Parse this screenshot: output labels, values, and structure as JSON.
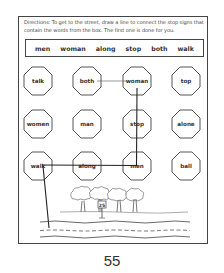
{
  "worksheet": {
    "directions": "Directions: To get to the street, draw a line to connect the stop signs that contain the words from the box. The first one is done for you.",
    "word_box": [
      "men",
      "woman",
      "along",
      "stop",
      "both",
      "walk"
    ],
    "stop_signs": [
      {
        "label": "talk",
        "row": 0,
        "col": 0
      },
      {
        "label": "both",
        "row": 0,
        "col": 1
      },
      {
        "label": "woman",
        "row": 0,
        "col": 2
      },
      {
        "label": "top",
        "row": 0,
        "col": 3
      },
      {
        "label": "women",
        "row": 1,
        "col": 0
      },
      {
        "label": "man",
        "row": 1,
        "col": 1
      },
      {
        "label": "stop",
        "row": 1,
        "col": 2
      },
      {
        "label": "alone",
        "row": 1,
        "col": 3
      },
      {
        "label": "walk",
        "row": 2,
        "col": 0
      },
      {
        "label": "along",
        "row": 2,
        "col": 1
      },
      {
        "label": "men",
        "row": 2,
        "col": 2
      },
      {
        "label": "ball",
        "row": 2,
        "col": 3
      }
    ],
    "path": [
      "both",
      "woman",
      "stop",
      "men",
      "along",
      "walk",
      "street"
    ],
    "street_sign": "25",
    "colors": {
      "ink": "#333333",
      "border": "#444444",
      "paper": "#ffffff"
    }
  },
  "page_number": "55"
}
